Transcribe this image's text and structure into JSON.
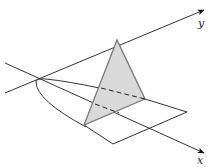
{
  "figure": {
    "type": "3d-solid-cross-section",
    "axes": {
      "x": {
        "label": "x"
      },
      "y": {
        "label": "y"
      }
    },
    "colors": {
      "line": "#333333",
      "triangle_fill": "#d9d9d9",
      "triangle_edge": "#777777"
    }
  }
}
